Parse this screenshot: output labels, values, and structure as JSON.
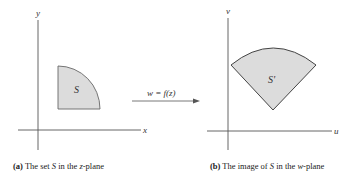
{
  "figure": {
    "panel_a": {
      "x_axis_label": "x",
      "y_axis_label": "y",
      "region_label": "S",
      "caption": {
        "tag": "(a)",
        "text_1": " The set ",
        "var": "S",
        "text_2": " in the ",
        "plane_var": "z",
        "text_3": "-plane"
      }
    },
    "mapping": {
      "label": "w = f(z)"
    },
    "panel_b": {
      "u_axis_label": "u",
      "v_axis_label": "v",
      "region_label": "S'",
      "caption": {
        "tag": "(b)",
        "text_1": " The image of ",
        "var": "S",
        "text_2": " in the ",
        "plane_var": "w",
        "text_3": "-plane"
      }
    },
    "colors": {
      "region_fill": "#dcdcdc",
      "region_stroke": "#555555",
      "axis_stroke": "#555555"
    }
  }
}
